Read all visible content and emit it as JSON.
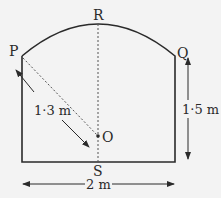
{
  "diagram": {
    "shape": "rectangle-with-circular-arc-top",
    "points": {
      "P": "P",
      "Q": "Q",
      "R": "R",
      "O": "O",
      "S": "S"
    },
    "dimensions": {
      "radius_label": "1·3 m",
      "height_label": "1·5 m",
      "width_label": "2 m"
    },
    "colors": {
      "line": "#2a2a2a",
      "background": "#f3f3f3"
    }
  }
}
